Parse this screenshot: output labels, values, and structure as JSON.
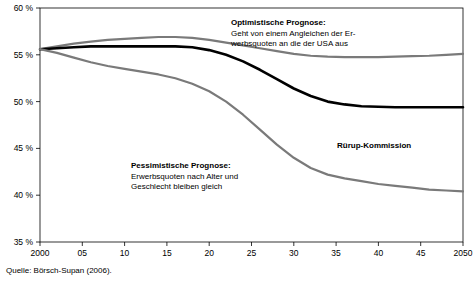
{
  "source_note": "Quelle: Börsch-Supan (2006).",
  "annotations": {
    "optimistic": {
      "title": "Optimistische Prognose:",
      "line1": "Geht von einem Angleichen der Er-",
      "line2": "werbsquoten an die der USA aus"
    },
    "pessimistic": {
      "title": "Pessimistische Prognose:",
      "line1": "Erwerbsquoten nach Alter und",
      "line2": "Geschlecht bleiben gleich"
    },
    "ruerup": {
      "title": "Rürup-Kommission"
    }
  },
  "chart_data": {
    "type": "line",
    "title": "",
    "xlabel": "",
    "ylabel": "",
    "xlim": [
      2000,
      2050
    ],
    "ylim": [
      35,
      60
    ],
    "yticks": [
      "35 %",
      "40 %",
      "45 %",
      "50 %",
      "55 %",
      "60 %"
    ],
    "ytick_values": [
      35,
      40,
      45,
      50,
      55,
      60
    ],
    "xticks": [
      "2000",
      "05",
      "10",
      "15",
      "20",
      "25",
      "30",
      "35",
      "40",
      "45",
      "2050"
    ],
    "xtick_values": [
      2000,
      2005,
      2010,
      2015,
      2020,
      2025,
      2030,
      2035,
      2040,
      2045,
      2050
    ],
    "grid": false,
    "legend_position": "inline-annotations",
    "series": [
      {
        "name": "Optimistische Prognose",
        "color": "#7a7a7a",
        "width": 2.2,
        "x": [
          2000,
          2002,
          2004,
          2006,
          2008,
          2010,
          2012,
          2014,
          2016,
          2018,
          2020,
          2022,
          2024,
          2026,
          2028,
          2030,
          2032,
          2034,
          2036,
          2038,
          2040,
          2042,
          2044,
          2046,
          2048,
          2050
        ],
        "values": [
          55.6,
          55.9,
          56.2,
          56.4,
          56.6,
          56.7,
          56.8,
          56.9,
          56.9,
          56.8,
          56.6,
          56.3,
          56.0,
          55.7,
          55.4,
          55.1,
          54.9,
          54.8,
          54.75,
          54.75,
          54.75,
          54.8,
          54.85,
          54.9,
          55.0,
          55.1
        ]
      },
      {
        "name": "Rürup-Kommission",
        "color": "#000000",
        "width": 2.6,
        "x": [
          2000,
          2002,
          2004,
          2006,
          2008,
          2010,
          2012,
          2014,
          2016,
          2018,
          2020,
          2022,
          2024,
          2026,
          2028,
          2030,
          2032,
          2034,
          2036,
          2038,
          2040,
          2042,
          2044,
          2046,
          2048,
          2050
        ],
        "values": [
          55.6,
          55.7,
          55.8,
          55.9,
          55.9,
          55.9,
          55.9,
          55.9,
          55.9,
          55.8,
          55.5,
          55.0,
          54.3,
          53.4,
          52.4,
          51.4,
          50.6,
          50.0,
          49.7,
          49.5,
          49.45,
          49.4,
          49.4,
          49.4,
          49.4,
          49.4
        ]
      },
      {
        "name": "Pessimistische Prognose",
        "color": "#7a7a7a",
        "width": 2.2,
        "x": [
          2000,
          2002,
          2004,
          2006,
          2008,
          2010,
          2012,
          2014,
          2016,
          2018,
          2020,
          2022,
          2024,
          2026,
          2028,
          2030,
          2032,
          2034,
          2036,
          2038,
          2040,
          2042,
          2044,
          2046,
          2048,
          2050
        ],
        "values": [
          55.6,
          55.2,
          54.7,
          54.2,
          53.8,
          53.5,
          53.2,
          52.9,
          52.5,
          51.9,
          51.1,
          50.0,
          48.6,
          47.0,
          45.4,
          44.0,
          42.9,
          42.2,
          41.8,
          41.5,
          41.2,
          41.0,
          40.8,
          40.6,
          40.5,
          40.4
        ]
      }
    ]
  }
}
